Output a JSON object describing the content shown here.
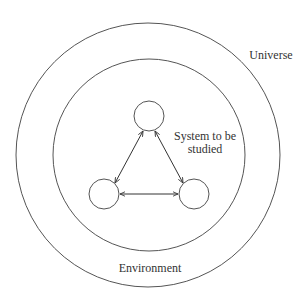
{
  "diagram": {
    "labels": {
      "universe": "Universe",
      "environment": "Environment",
      "system_line1": "System to be",
      "system_line2": "studied"
    },
    "regions": [
      {
        "name": "universe",
        "shape": "circle",
        "cx": 148,
        "cy": 155,
        "r": 132
      },
      {
        "name": "environment",
        "shape": "circle",
        "cx": 149,
        "cy": 155,
        "r": 96
      }
    ],
    "nodes": [
      {
        "id": "top",
        "cx": 149,
        "cy": 116,
        "r": 15
      },
      {
        "id": "bottom-left",
        "cx": 104,
        "cy": 194,
        "r": 15
      },
      {
        "id": "bottom-right",
        "cx": 194,
        "cy": 194,
        "r": 15
      }
    ],
    "edges": [
      {
        "from": "top",
        "to": "bottom-left",
        "direction": "bidirectional"
      },
      {
        "from": "top",
        "to": "bottom-right",
        "direction": "bidirectional"
      },
      {
        "from": "bottom-left",
        "to": "bottom-right",
        "direction": "bidirectional"
      }
    ],
    "colors": {
      "stroke": "#555555",
      "text": "#333333",
      "background": "#ffffff"
    }
  }
}
